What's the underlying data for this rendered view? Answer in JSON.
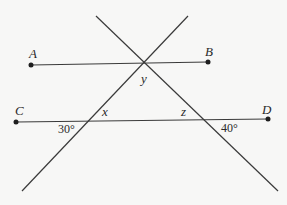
{
  "diagram": {
    "points": {
      "A": "A",
      "B": "B",
      "C": "C",
      "D": "D"
    },
    "angles": {
      "x": "x",
      "y": "y",
      "z": "z",
      "left_given": "30°",
      "right_given": "40°"
    },
    "colors": {
      "line": "#3a3a3a",
      "text": "#2a2a2a",
      "background": "#f7f7f6"
    }
  }
}
